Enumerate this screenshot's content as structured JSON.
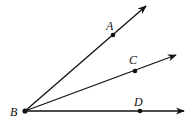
{
  "diagram": {
    "type": "geometry-rays",
    "colors": {
      "stroke": "#111111",
      "background": "#ffffff"
    },
    "vertex": {
      "label": "B",
      "x": 25,
      "y": 111,
      "label_x": 10,
      "label_y": 116
    },
    "rays": [
      {
        "name": "ray-BA",
        "point_label": "A",
        "point": {
          "x": 113,
          "y": 35
        },
        "end": {
          "x": 146,
          "y": 6
        },
        "label_pos": {
          "x": 106,
          "y": 30
        }
      },
      {
        "name": "ray-BC",
        "point_label": "C",
        "point": {
          "x": 135,
          "y": 71
        },
        "end": {
          "x": 176,
          "y": 55
        },
        "label_pos": {
          "x": 129,
          "y": 64
        }
      },
      {
        "name": "ray-BD",
        "point_label": "D",
        "point": {
          "x": 140,
          "y": 111
        },
        "end": {
          "x": 184,
          "y": 111
        },
        "label_pos": {
          "x": 134,
          "y": 106
        }
      }
    ]
  }
}
